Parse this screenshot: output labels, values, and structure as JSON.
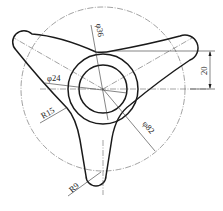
{
  "drawing": {
    "title": "Three-lobed handwheel",
    "dimensions": {
      "pitch_circle": "φ82",
      "hub_outer": "φ36",
      "bore": "φ24",
      "fillet_radius": "R15",
      "tip_radius": "R9",
      "offset": "20"
    },
    "colors": {
      "line": "#1a1a1a",
      "background": "#ffffff"
    }
  }
}
